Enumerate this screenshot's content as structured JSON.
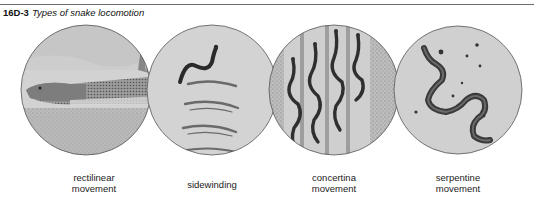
{
  "caption": {
    "figure_number": "16D-3",
    "title": "Types of snake locomotion"
  },
  "panels": [
    {
      "label_line1": "rectilinear",
      "label_line2": "movement",
      "icon": "rectilinear-snake-illustration"
    },
    {
      "label_line1": "sidewinding",
      "label_line2": "",
      "icon": "sidewinding-snake-illustration"
    },
    {
      "label_line1": "concertina",
      "label_line2": "movement",
      "icon": "concertina-snake-illustration"
    },
    {
      "label_line1": "serpentine",
      "label_line2": "movement",
      "icon": "serpentine-snake-illustration"
    }
  ],
  "colors": {
    "circle_fill": "#cfcfcf",
    "circle_stroke": "#555555",
    "snake": "#2e2e2e",
    "stripe": "#9a9a9a"
  }
}
